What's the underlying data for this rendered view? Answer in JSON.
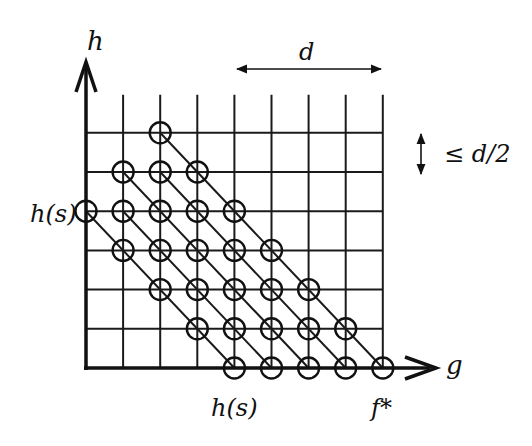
{
  "diagram": {
    "axes": {
      "x_label": "g",
      "y_label": "h"
    },
    "labels": {
      "left_tick": "h(s)",
      "bottom_tick": "h(s)",
      "bottom_end": "f*",
      "width_annotation": "d",
      "height_annotation": "≤ d/2"
    },
    "grid": {
      "columns": 8,
      "rows": 6,
      "origin_px": [
        86,
        368
      ],
      "col_spacing_px": 37.1,
      "row_spacing_px": 39.2
    },
    "nodes": [
      {
        "col": 2,
        "row": 6
      },
      {
        "col": 1,
        "row": 5
      },
      {
        "col": 2,
        "row": 5
      },
      {
        "col": 3,
        "row": 5
      },
      {
        "col": 0,
        "row": 4
      },
      {
        "col": 1,
        "row": 4
      },
      {
        "col": 2,
        "row": 4
      },
      {
        "col": 3,
        "row": 4
      },
      {
        "col": 4,
        "row": 4
      },
      {
        "col": 1,
        "row": 3
      },
      {
        "col": 2,
        "row": 3
      },
      {
        "col": 3,
        "row": 3
      },
      {
        "col": 4,
        "row": 3
      },
      {
        "col": 5,
        "row": 3
      },
      {
        "col": 2,
        "row": 2
      },
      {
        "col": 3,
        "row": 2
      },
      {
        "col": 4,
        "row": 2
      },
      {
        "col": 5,
        "row": 2
      },
      {
        "col": 6,
        "row": 2
      },
      {
        "col": 3,
        "row": 1
      },
      {
        "col": 4,
        "row": 1
      },
      {
        "col": 5,
        "row": 1
      },
      {
        "col": 6,
        "row": 1
      },
      {
        "col": 7,
        "row": 1
      },
      {
        "col": 4,
        "row": 0
      },
      {
        "col": 5,
        "row": 0
      },
      {
        "col": 6,
        "row": 0
      },
      {
        "col": 7,
        "row": 0
      },
      {
        "col": 8,
        "row": 0
      }
    ],
    "diagonals": [
      {
        "from": [
          0,
          4
        ],
        "to": [
          4,
          0
        ]
      },
      {
        "from": [
          1,
          4
        ],
        "to": [
          5,
          0
        ]
      },
      {
        "from": [
          1,
          5
        ],
        "to": [
          6,
          0
        ]
      },
      {
        "from": [
          2,
          5
        ],
        "to": [
          7,
          0
        ]
      },
      {
        "from": [
          2,
          6
        ],
        "to": [
          8,
          0
        ]
      }
    ]
  }
}
